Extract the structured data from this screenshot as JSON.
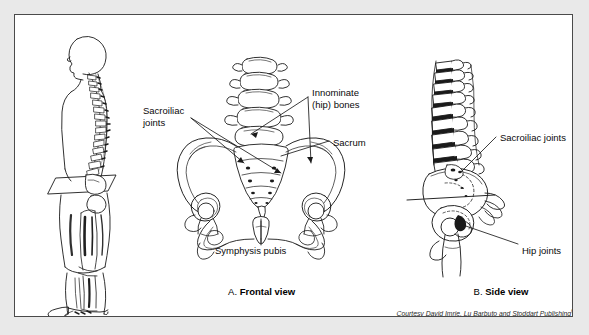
{
  "figure": {
    "panel_background": "#ffffff",
    "page_background": "#e9e9e9",
    "border_color": "#4a4a4a",
    "ink_color": "#1a1a1a"
  },
  "left_illustration": {
    "name": "standing-human-figure-side-profile",
    "description": "Side profile of a standing human body showing the vertebral column, pelvis with a tilted pelvic plane marker, and leg bones"
  },
  "frontal_view": {
    "name": "pelvis-frontal-view",
    "labels": [
      {
        "id": "sacroiliac-joints",
        "text": "Sacroiliac\njoints",
        "x": 128,
        "y": 90,
        "align": "left"
      },
      {
        "id": "innominate-hip-bones",
        "text": "Innominate\n(hip) bones",
        "x": 297,
        "y": 72,
        "align": "left"
      },
      {
        "id": "sacrum",
        "text": "Sacrum",
        "x": 318,
        "y": 122,
        "align": "left"
      },
      {
        "id": "symphysis-pubis",
        "text": "Symphysis pubis",
        "x": 200,
        "y": 230,
        "align": "left"
      }
    ],
    "caption_prefix": "A.",
    "caption_title": "Frontal view"
  },
  "side_view": {
    "name": "pelvis-side-view",
    "labels": [
      {
        "id": "sacroiliac-joints",
        "text": "Sacroiliac joints",
        "x": 485,
        "y": 117,
        "align": "left"
      },
      {
        "id": "hip-joints",
        "text": "Hip joints",
        "x": 507,
        "y": 230,
        "align": "left"
      }
    ],
    "caption_prefix": "B.",
    "caption_title": "Side view"
  },
  "credit": {
    "text": "Courtesy David Imrie, Lu Barbuto and Stoddart Publishing",
    "superscript": "60"
  }
}
